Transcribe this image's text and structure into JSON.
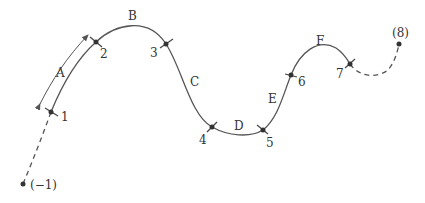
{
  "diagram": {
    "type": "piecewise spline curve with knots",
    "knots": [
      {
        "id": "p-1",
        "label": "(-1)",
        "x": 23,
        "y": 184,
        "virtual": true
      },
      {
        "id": "p1",
        "label": "1",
        "x": 51,
        "y": 112
      },
      {
        "id": "p2",
        "label": "2",
        "x": 96,
        "y": 42
      },
      {
        "id": "p3",
        "label": "3",
        "x": 166,
        "y": 44
      },
      {
        "id": "p4",
        "label": "4",
        "x": 212,
        "y": 127
      },
      {
        "id": "p5",
        "label": "5",
        "x": 263,
        "y": 130
      },
      {
        "id": "p6",
        "label": "6",
        "x": 291,
        "y": 75
      },
      {
        "id": "p7",
        "label": "7",
        "x": 350,
        "y": 64
      },
      {
        "id": "p8",
        "label": "(8)",
        "x": 399,
        "y": 44,
        "virtual": true
      }
    ],
    "segments": [
      {
        "label": "A",
        "from": "1",
        "to": "2"
      },
      {
        "label": "B",
        "from": "2",
        "to": "3"
      },
      {
        "label": "C",
        "from": "3",
        "to": "4"
      },
      {
        "label": "D",
        "from": "4",
        "to": "5"
      },
      {
        "label": "E",
        "from": "5",
        "to": "6"
      },
      {
        "label": "F",
        "from": "6",
        "to": "7"
      }
    ],
    "labels": {
      "pm1": "(−1)",
      "p1": "1",
      "p2": "2",
      "p3": "3",
      "p4": "4",
      "p5": "5",
      "p6": "6",
      "p7": "7",
      "p8": "(8)",
      "A": "A",
      "B": "B",
      "C": "C",
      "D": "D",
      "E": "E",
      "F": "F"
    }
  }
}
